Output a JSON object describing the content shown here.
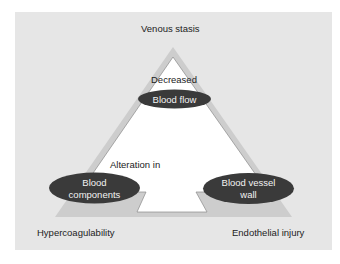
{
  "diagram": {
    "corner_labels": {
      "top": "Venous stasis",
      "bottom_left": "Hypercoagulability",
      "bottom_right": "Endothelial injury"
    },
    "inner_labels": {
      "top_modifier": "Decreased",
      "left_modifier": "Alteration in"
    },
    "nodes": [
      {
        "id": "blood-flow",
        "label": "Blood flow",
        "position": "apex"
      },
      {
        "id": "blood-components",
        "label_line1": "Blood",
        "label_line2": "components",
        "position": "bottom-left"
      },
      {
        "id": "blood-vessel-wall",
        "label_line1": "Blood vessel",
        "label_line2": "wall",
        "position": "bottom-right"
      }
    ],
    "colors": {
      "panel": "#e6e6e6",
      "band": "#cdcdcd",
      "inner": "#ffffff",
      "ellipse": "#3a3a3a",
      "ellipse_text": "#f2f2f2",
      "text": "#222222"
    }
  }
}
